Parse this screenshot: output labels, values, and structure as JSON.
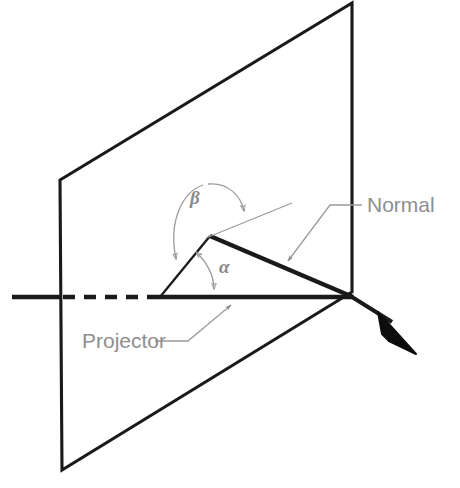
{
  "figure": {
    "background_color": "#ffffff",
    "line_color": "#1a1a1a",
    "annotation_color": "#8e8e8e"
  },
  "labels": {
    "normal": "Normal",
    "projector": "Projector",
    "alpha": "α",
    "beta": "β"
  },
  "caption_partial": "",
  "geometry": {
    "plane": {
      "name": "projection-plane",
      "corners": [
        [
          60,
          180
        ],
        [
          352,
          3
        ],
        [
          352,
          292
        ],
        [
          62,
          470
        ]
      ],
      "note": "Parallelogram representing the plane of projection drawn in pictorial view"
    },
    "projector_line": {
      "name": "projector-ray",
      "solid_start": [
        12,
        297
      ],
      "dashed_start": [
        62,
        297
      ],
      "dashed_end": [
        158,
        297
      ],
      "arrow_tip": [
        412,
        351
      ],
      "pierce_point": [
        352,
        297
      ]
    },
    "normal_line": {
      "name": "normal-ray",
      "from": [
        210,
        236
      ],
      "to": [
        352,
        297
      ]
    },
    "triangle": {
      "vertices": [
        [
          160,
          297
        ],
        [
          210,
          236
        ],
        [
          352,
          297
        ]
      ]
    },
    "normal_extension": {
      "from": [
        210,
        236
      ],
      "to": [
        290,
        205
      ]
    },
    "angles": {
      "alpha": {
        "label": "α",
        "label_pos": [
          222,
          266
        ],
        "description": "angle between the projector and the plane of projection"
      },
      "beta": {
        "label": "β",
        "label_pos": [
          196,
          198
        ],
        "description": "angle between the projector and the normal to the plane"
      }
    },
    "leaders": {
      "normal": {
        "text_pos": [
          368,
          212
        ],
        "elbow": [
          330,
          205
        ],
        "horizontal_end": [
          362,
          205
        ],
        "arrow_tip": [
          286,
          263
        ]
      },
      "projector": {
        "text_pos": [
          82,
          348
        ],
        "elbow": [
          187,
          341
        ],
        "horizontal_start": [
          155,
          341
        ],
        "arrow_tip": [
          230,
          304
        ]
      }
    }
  }
}
